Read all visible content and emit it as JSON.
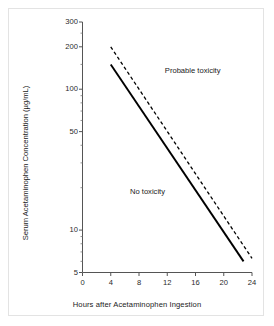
{
  "chart_data": {
    "type": "line",
    "title": "",
    "xlabel": "Hours after Acetaminophen Ingestion",
    "ylabel": "Serum Acetaminophen Concentration (µg/mL)",
    "xlim": [
      0,
      24
    ],
    "ylim": [
      5,
      300
    ],
    "yscale": "log",
    "xscale": "linear",
    "grid": false,
    "legend": null,
    "xticks": [
      "0",
      "4",
      "8",
      "12",
      "16",
      "20",
      "24"
    ],
    "xtick_values": [
      0,
      4,
      8,
      12,
      16,
      20,
      24
    ],
    "yticks": [
      "300",
      "200",
      "100",
      "50",
      "10",
      "5"
    ],
    "ytick_values": [
      300,
      200,
      100,
      50,
      10,
      5
    ],
    "yminor_ticks": [
      6,
      7,
      8,
      9,
      20,
      30,
      40,
      60,
      70,
      80,
      90,
      150,
      250
    ],
    "series": [
      {
        "name": "Probable toxicity line (upper, dashed)",
        "style": "dashed",
        "color": "#000000",
        "x": [
          4,
          24
        ],
        "y": [
          200,
          6.3
        ]
      },
      {
        "name": "Treatment line (lower, solid)",
        "style": "solid",
        "color": "#000000",
        "x": [
          4,
          22.8
        ],
        "y": [
          150,
          6.0
        ]
      }
    ],
    "annotations": [
      {
        "text": "Probable toxicity",
        "x": 15.6,
        "y": 135,
        "name": "probable-toxicity-label"
      },
      {
        "text": "No toxicity",
        "x": 9.2,
        "y": 18.5,
        "name": "no-toxicity-label"
      }
    ]
  },
  "figure": {
    "background": "#ffffff",
    "frame_color": "#e3e3e3",
    "axis_color": "#555555",
    "text_color": "#1a1a1a"
  }
}
